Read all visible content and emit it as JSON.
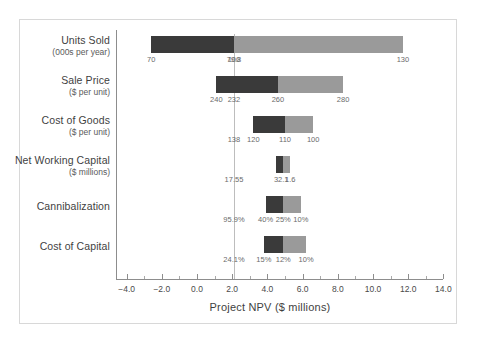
{
  "chart_data": {
    "type": "bar",
    "subtype": "tornado",
    "title": "",
    "xlabel": "Project NPV ($ millions)",
    "ylabel": "",
    "xlim": [
      -4.0,
      14.0
    ],
    "xticks": [
      -4.0,
      -2.0,
      0.0,
      2.0,
      4.0,
      6.0,
      8.0,
      10.0,
      12.0,
      14.0
    ],
    "xticklabels": [
      "−4.0",
      "−2.0",
      "0.0",
      "2.0",
      "4.0",
      "6.0",
      "8.0",
      "10.0",
      "12.0",
      "14.0"
    ],
    "minor_tick_step": 1.0,
    "grid": false,
    "legend": null,
    "base_case_line": 2.1,
    "colors": {
      "low": "#3a3a3a",
      "high": "#9a9a9a",
      "axis": "#8d8d8d",
      "frame": "#d8d8d8",
      "text": "#3f3f3f"
    },
    "categories": [
      {
        "name": "Units Sold",
        "unit": "(000s per year)",
        "low_npv": -2.6,
        "base_npv": 2.1,
        "high_npv": 11.7,
        "input_low_label": "70",
        "input_base_label": "79.8",
        "input_high_label": "130",
        "input_mid_label": "100",
        "input_mid_npv": 2.1
      },
      {
        "name": "Sale Price",
        "unit": "($ per unit)",
        "low_npv": 1.1,
        "base_npv": 2.1,
        "high_npv": 8.3,
        "input_low_label": "240",
        "input_base_label": "232",
        "input_high_label": "280",
        "input_mid_label": "260",
        "input_mid_npv": 4.6
      },
      {
        "name": "Cost of Goods",
        "unit": "($ per unit)",
        "low_npv": 3.2,
        "base_npv": 2.1,
        "high_npv": 6.6,
        "input_low_label": "120",
        "input_base_label": "138",
        "input_high_label": "100",
        "input_mid_label": "110",
        "input_mid_npv": 5.0
      },
      {
        "name": "Net Working Capital",
        "unit": "($ millions)",
        "low_npv": 4.5,
        "base_npv": 2.1,
        "high_npv": 5.3,
        "input_low_label": "3",
        "input_base_label": "17.55",
        "input_high_label": "1.6",
        "input_mid_label": "2.1",
        "input_mid_npv": 4.9
      },
      {
        "name": "Cannibalization",
        "unit": "",
        "low_npv": 3.9,
        "base_npv": 2.1,
        "high_npv": 5.9,
        "input_low_label": "40%",
        "input_base_label": "95.9%",
        "input_high_label": "10%",
        "input_mid_label": "25%",
        "input_mid_npv": 4.9
      },
      {
        "name": "Cost of Capital",
        "unit": "",
        "low_npv": 3.8,
        "base_npv": 2.1,
        "high_npv": 6.2,
        "input_low_label": "15%",
        "input_base_label": "24.1%",
        "input_high_label": "10%",
        "input_mid_label": "12%",
        "input_mid_npv": 4.9
      }
    ]
  }
}
